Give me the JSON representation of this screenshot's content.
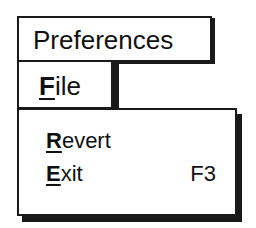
{
  "window": {
    "title": "Preferences"
  },
  "menubar": {
    "items": [
      {
        "mnemonic": "F",
        "rest": "ile",
        "label": "File"
      }
    ]
  },
  "menu": {
    "items": [
      {
        "mnemonic": "R",
        "rest": "evert",
        "label": "Revert",
        "accelerator": ""
      },
      {
        "mnemonic": "E",
        "rest": "xit",
        "label": "Exit",
        "accelerator": "F3"
      }
    ]
  }
}
